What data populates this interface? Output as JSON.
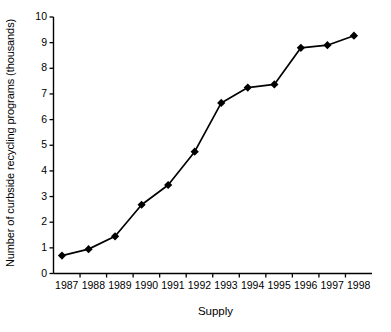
{
  "chart_data": {
    "type": "line",
    "title": "",
    "subtitle": "",
    "xlabel": "Supply",
    "ylabel": "Number of curbside recycling programs (thousands)",
    "categories": [
      "1987",
      "1988",
      "1989",
      "1990",
      "1991",
      "1992",
      "1993",
      "1994",
      "1995",
      "1996",
      "1997",
      "1998"
    ],
    "x": [
      1987,
      1988,
      1989,
      1990,
      1991,
      1992,
      1993,
      1994,
      1995,
      1996,
      1997,
      1998
    ],
    "values": [
      0.7,
      0.95,
      1.45,
      2.68,
      3.45,
      4.75,
      6.65,
      7.25,
      7.37,
      8.8,
      8.9,
      9.27
    ],
    "series": [
      {
        "name": "Number of curbside recycling programs (thousands)",
        "values": [
          0.7,
          0.95,
          1.45,
          2.68,
          3.45,
          4.75,
          6.65,
          7.25,
          7.37,
          8.8,
          8.9,
          9.27
        ],
        "color": "#000000",
        "marker": "diamond",
        "line_style": "solid"
      }
    ],
    "ylim": [
      0,
      10
    ],
    "ytick_values": [
      0,
      1,
      2,
      3,
      4,
      5,
      6,
      7,
      8,
      9,
      10
    ],
    "ytick_labels": [
      "0",
      "1",
      "2",
      "3",
      "4",
      "5",
      "6",
      "7",
      "8",
      "9",
      "10"
    ],
    "xtick_labels": [
      "1987",
      "1988",
      "1989",
      "1990",
      "1991",
      "1992",
      "1993",
      "1994",
      "1995",
      "1996",
      "1997",
      "1998"
    ],
    "grid": false,
    "legend": false,
    "legend_position": "none",
    "annotations": [],
    "background_color": "#ffffff",
    "axis_color": "#000000"
  },
  "axes": {
    "y_title": "Number of curbside recycling programs (thousands)",
    "x_title": "Supply",
    "y_ticks": [
      "0",
      "1",
      "2",
      "3",
      "4",
      "5",
      "6",
      "7",
      "8",
      "9",
      "10"
    ],
    "x_ticks": [
      "1987",
      "1988",
      "1989",
      "1990",
      "1991",
      "1992",
      "1993",
      "1994",
      "1995",
      "1996",
      "1997",
      "1998"
    ]
  }
}
